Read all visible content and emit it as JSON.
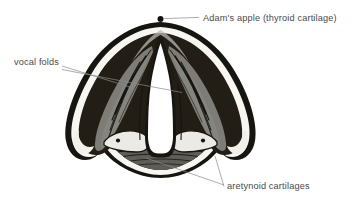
{
  "figure": {
    "kind": "anatomical-illustration",
    "background_color": "#ffffff",
    "width": 358,
    "height": 202
  },
  "labels": [
    {
      "id": "adams-apple",
      "text": "Adam's apple (thyroid cartilage)",
      "text_x": 203,
      "text_y": 21,
      "anchor": "start",
      "marker": {
        "x": 160.5,
        "y": 19.0,
        "r": 3.0
      },
      "leaders": [
        {
          "x1": 164.0,
          "y1": 18.6,
          "x2": 199.0,
          "y2": 17.4
        }
      ]
    },
    {
      "id": "vocal-folds",
      "text": "vocal folds",
      "text_x": 14,
      "text_y": 65,
      "anchor": "start",
      "marker": null,
      "leaders": [
        {
          "x1": 62.0,
          "y1": 66.0,
          "x2": 133.0,
          "y2": 88.0
        },
        {
          "x1": 62.0,
          "y1": 69.5,
          "x2": 182.0,
          "y2": 92.5
        }
      ]
    },
    {
      "id": "aretynoid-cartilages",
      "text": "aretynoid cartilages",
      "text_x": 227,
      "text_y": 189,
      "anchor": "start",
      "marker": null,
      "leaders": [
        {
          "x1": 146.0,
          "y1": 158.0,
          "x2": 224.0,
          "y2": 185.0
        },
        {
          "x1": 215.0,
          "y1": 156.0,
          "x2": 224.0,
          "y2": 186.5
        }
      ]
    }
  ],
  "palette": {
    "ink_black": "#17150f",
    "dark_tissue": "#221e15",
    "mid_gray": "#7d7c76",
    "light_gray": "#b9b8b2",
    "highlight_white": "#f7f6f2",
    "paper": "#ffffff",
    "leader_gray": "#8a8a8a",
    "text_gray": "#4a4a4a"
  },
  "anatomy_parts": [
    {
      "id": "thyroid-cartilage-outline",
      "name": "thyroid cartilage outer rim"
    },
    {
      "id": "inner-white-band",
      "name": "inner white highlight band"
    },
    {
      "id": "vocal-fold-left",
      "name": "left vocal fold"
    },
    {
      "id": "vocal-fold-right",
      "name": "right vocal fold"
    },
    {
      "id": "glottis",
      "name": "glottis (airway opening)"
    },
    {
      "id": "arytenoid-left",
      "name": "left arytenoid cartilage"
    },
    {
      "id": "arytenoid-right",
      "name": "right arytenoid cartilage"
    },
    {
      "id": "posterior-wall",
      "name": "posterior laryngeal wall"
    }
  ]
}
